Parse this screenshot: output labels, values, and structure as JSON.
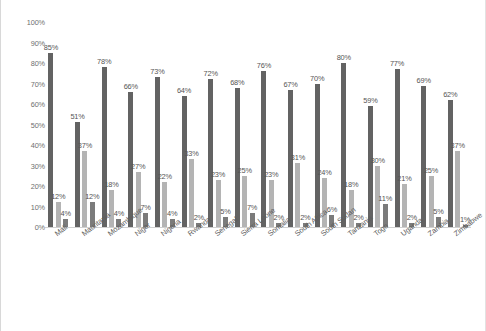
{
  "chart_data": {
    "type": "bar",
    "title": "",
    "subtitle": "",
    "xlabel": "",
    "ylabel": "",
    "ylim": [
      0,
      100
    ],
    "ytick_labels": [
      "100%",
      "90%",
      "80%",
      "70%",
      "60%",
      "50%",
      "40%",
      "30%",
      "20%",
      "10%",
      "0%"
    ],
    "ytick_values": [
      100,
      90,
      80,
      70,
      60,
      50,
      40,
      30,
      20,
      10,
      0
    ],
    "grid": false,
    "legend": "none",
    "value_suffix": "%",
    "categories": [
      "Mali",
      "Mauritania",
      "Mozambique",
      "Niger",
      "Nigeria",
      "Rwanda",
      "Senegal",
      "Sierra Leone",
      "Somalia",
      "South Africa",
      "South Sudan",
      "Tanzania",
      "Togo",
      "Uganda",
      "Zambia",
      "Zimbabwe"
    ],
    "series": [
      {
        "name": "series-1",
        "color": "#636363",
        "values": [
          85,
          51,
          78,
          66,
          73,
          64,
          72,
          68,
          76,
          67,
          70,
          80,
          59,
          77,
          69,
          62
        ],
        "labels": [
          "85%",
          "51%",
          "78%",
          "66%",
          "73%",
          "64%",
          "72%",
          "68%",
          "76%",
          "67%",
          "70%",
          "80%",
          "59%",
          "77%",
          "69%",
          "62%"
        ]
      },
      {
        "name": "series-2",
        "color": "#b4b4b4",
        "values": [
          12,
          37,
          18,
          27,
          22,
          33,
          23,
          25,
          23,
          31,
          24,
          18,
          30,
          21,
          25,
          37
        ],
        "labels": [
          "12%",
          "37%",
          "18%",
          "27%",
          "22%",
          "33%",
          "23%",
          "25%",
          "23%",
          "31%",
          "24%",
          "18%",
          "30%",
          "21%",
          "25%",
          "37%"
        ]
      },
      {
        "name": "series-3",
        "color": "#7b7b7b",
        "values": [
          4,
          12,
          4,
          7,
          4,
          2,
          5,
          7,
          2,
          2,
          6,
          2,
          11,
          2,
          5,
          1
        ],
        "labels": [
          "4%",
          "12%",
          "4%",
          "7%",
          "4%",
          "2%",
          "5%",
          "7%",
          "2%",
          "2%",
          "6%",
          "2%",
          "11%",
          "2%",
          "5%",
          "1%"
        ]
      }
    ]
  }
}
